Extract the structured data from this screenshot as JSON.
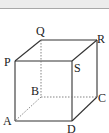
{
  "figure": {
    "type": "cube",
    "vertices": {
      "P": {
        "label": "P",
        "x": 15,
        "y": 61
      },
      "Q": {
        "label": "Q",
        "x": 41,
        "y": 40
      },
      "R": {
        "label": "R",
        "x": 97,
        "y": 40
      },
      "S": {
        "label": "S",
        "x": 72,
        "y": 61
      },
      "A": {
        "label": "A",
        "x": 15,
        "y": 121
      },
      "B": {
        "label": "B",
        "x": 41,
        "y": 97
      },
      "C": {
        "label": "C",
        "x": 97,
        "y": 97
      },
      "D": {
        "label": "D",
        "x": 72,
        "y": 121
      }
    },
    "solid_edges": [
      "PQ",
      "QR",
      "RS",
      "SP",
      "PA",
      "AD",
      "DS",
      "DC",
      "CR"
    ],
    "hidden_edges": [
      "QB",
      "BA",
      "BC"
    ],
    "colors": {
      "edge": "#333333",
      "hidden": "#777777",
      "band": "#ececec",
      "band_border": "#a8a8a8"
    }
  }
}
